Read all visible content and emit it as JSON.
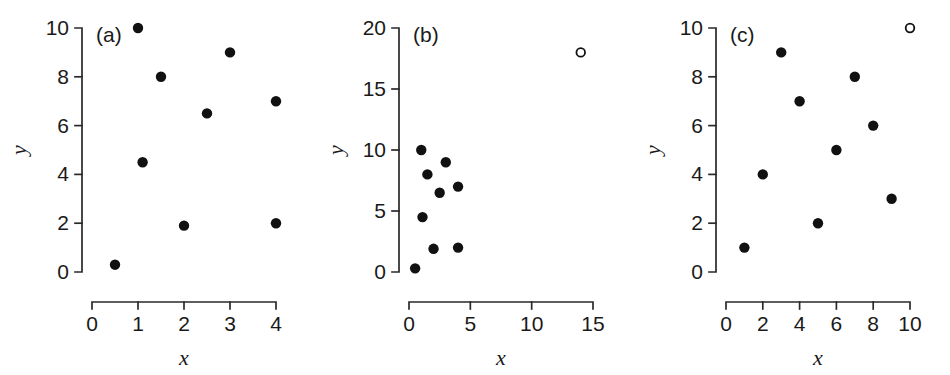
{
  "figure": {
    "width": 950,
    "height": 375,
    "background": "#ffffff",
    "marker_filled_color": "#111111",
    "marker_open_color": "#ffffff",
    "axis_color": "#2a2a2a"
  },
  "panels": [
    {
      "tag": "(a)",
      "xlabel": "x",
      "ylabel": "y",
      "xticks": [
        "0",
        "1",
        "2",
        "3",
        "4"
      ],
      "yticks": [
        "0",
        "2",
        "4",
        "6",
        "8",
        "10"
      ]
    },
    {
      "tag": "(b)",
      "xlabel": "x",
      "ylabel": "y",
      "xticks": [
        "0",
        "5",
        "10",
        "15"
      ],
      "yticks": [
        "0",
        "5",
        "10",
        "15",
        "20"
      ]
    },
    {
      "tag": "(c)",
      "xlabel": "x",
      "ylabel": "y",
      "xticks": [
        "0",
        "2",
        "4",
        "6",
        "8",
        "10"
      ],
      "yticks": [
        "0",
        "2",
        "4",
        "6",
        "8",
        "10"
      ]
    }
  ],
  "chart_data": [
    {
      "type": "scatter",
      "title": "(a)",
      "xlabel": "x",
      "ylabel": "y",
      "xlim": [
        0,
        4
      ],
      "ylim": [
        0,
        10
      ],
      "xticks": [
        0,
        1,
        2,
        3,
        4
      ],
      "yticks": [
        0,
        2,
        4,
        6,
        8,
        10
      ],
      "grid": false,
      "legend": null,
      "series": [
        {
          "name": "data",
          "marker": "filled-circle",
          "points": [
            {
              "x": 0.5,
              "y": 0.3
            },
            {
              "x": 1.0,
              "y": 10.0
            },
            {
              "x": 1.1,
              "y": 4.5
            },
            {
              "x": 1.5,
              "y": 8.0
            },
            {
              "x": 2.0,
              "y": 1.9
            },
            {
              "x": 2.5,
              "y": 6.5
            },
            {
              "x": 3.0,
              "y": 9.0
            },
            {
              "x": 4.0,
              "y": 7.0
            },
            {
              "x": 4.0,
              "y": 2.0
            }
          ]
        }
      ]
    },
    {
      "type": "scatter",
      "title": "(b)",
      "xlabel": "x",
      "ylabel": "y",
      "xlim": [
        0,
        15
      ],
      "ylim": [
        0,
        20
      ],
      "xticks": [
        0,
        5,
        10,
        15
      ],
      "yticks": [
        0,
        5,
        10,
        15,
        20
      ],
      "grid": false,
      "legend": null,
      "series": [
        {
          "name": "data",
          "marker": "filled-circle",
          "points": [
            {
              "x": 0.5,
              "y": 0.3
            },
            {
              "x": 1.0,
              "y": 10.0
            },
            {
              "x": 1.1,
              "y": 4.5
            },
            {
              "x": 1.5,
              "y": 8.0
            },
            {
              "x": 2.0,
              "y": 1.9
            },
            {
              "x": 2.5,
              "y": 6.5
            },
            {
              "x": 3.0,
              "y": 9.0
            },
            {
              "x": 4.0,
              "y": 7.0
            },
            {
              "x": 4.0,
              "y": 2.0
            }
          ]
        },
        {
          "name": "outlier",
          "marker": "open-circle",
          "points": [
            {
              "x": 14.0,
              "y": 18.0
            }
          ]
        }
      ]
    },
    {
      "type": "scatter",
      "title": "(c)",
      "xlabel": "x",
      "ylabel": "y",
      "xlim": [
        0,
        10
      ],
      "ylim": [
        0,
        10
      ],
      "xticks": [
        0,
        2,
        4,
        6,
        8,
        10
      ],
      "yticks": [
        0,
        2,
        4,
        6,
        8,
        10
      ],
      "grid": false,
      "legend": null,
      "series": [
        {
          "name": "data",
          "marker": "filled-circle",
          "points": [
            {
              "x": 1,
              "y": 1
            },
            {
              "x": 2,
              "y": 4
            },
            {
              "x": 3,
              "y": 9
            },
            {
              "x": 4,
              "y": 7
            },
            {
              "x": 5,
              "y": 2
            },
            {
              "x": 6,
              "y": 5
            },
            {
              "x": 7,
              "y": 8
            },
            {
              "x": 8,
              "y": 6
            },
            {
              "x": 9,
              "y": 3
            }
          ]
        },
        {
          "name": "outlier",
          "marker": "open-circle",
          "points": [
            {
              "x": 10,
              "y": 10
            }
          ]
        }
      ]
    }
  ]
}
